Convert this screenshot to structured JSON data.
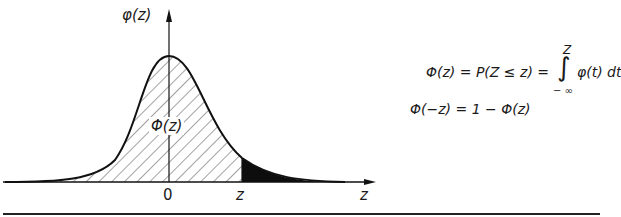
{
  "diagram": {
    "y_axis_label": "φ(z)",
    "area_label": "Φ(z)",
    "x_ticks": [
      "0",
      "z"
    ],
    "x_axis_label": "z",
    "hatched_region": "left of z (Φ(z))",
    "filled_region": "right of z (tail)"
  },
  "formulas": {
    "line1_lhs": "Φ(z) = P(Z ≤ z) =",
    "line1_integral_upper": "Z",
    "line1_integral_symbol": "∫",
    "line1_integral_lower": "− ∞",
    "line1_integrand": "φ(t) dt",
    "line2": "Φ(−z) = 1 − Φ(z)"
  },
  "colors": {
    "ink": "#111111",
    "background": "#ffffff"
  }
}
